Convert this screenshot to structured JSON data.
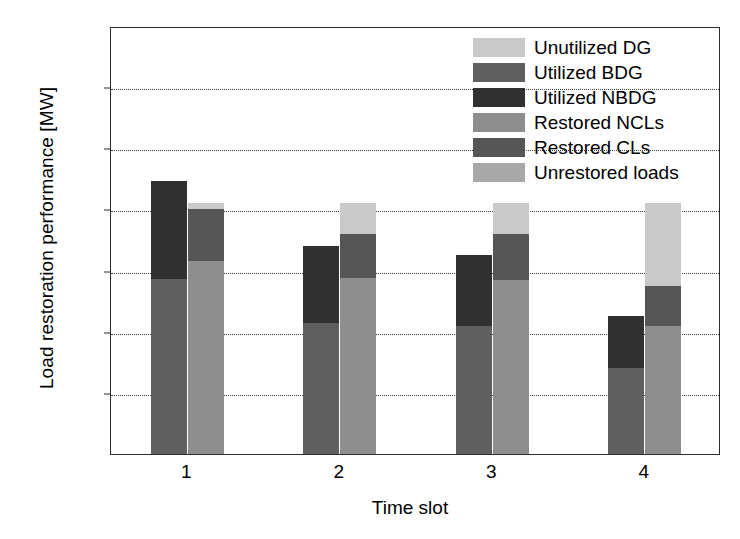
{
  "chart_data": {
    "type": "bar",
    "title": "",
    "xlabel": "Time slot",
    "ylabel": "Load restoration performance [MW]",
    "categories": [
      "1",
      "2",
      "3",
      "4"
    ],
    "ylim": [
      0,
      70
    ],
    "yticks": [
      0,
      10,
      20,
      30,
      40,
      50,
      60,
      70
    ],
    "ytick_labels": [
      "0",
      "10",
      "20",
      "30",
      "40",
      "50",
      "60",
      "70"
    ],
    "grid": true,
    "grid_style": "dotted",
    "legend_position": "top-right",
    "stacked": true,
    "grouped_bars_per_category": 2,
    "legend": [
      {
        "label": "Unutilized DG",
        "color": "#c9c9c9"
      },
      {
        "label": "Utilized BDG",
        "color": "#5f5f5f"
      },
      {
        "label": "Utilized NBDG",
        "color": "#303030"
      },
      {
        "label": "Restored NCLs",
        "color": "#8e8e8e"
      },
      {
        "label": "Restored CLs",
        "color": "#565656"
      },
      {
        "label": "Unrestored loads",
        "color": "#a8a8a8"
      }
    ],
    "series": [
      {
        "name": "Utilized BDG",
        "color": "#5f5f5f",
        "bar": "generation",
        "values": [
          28.6,
          21.5,
          21.0,
          14.0
        ]
      },
      {
        "name": "Utilized NBDG",
        "color": "#303030",
        "bar": "generation",
        "values": [
          16.0,
          12.5,
          11.5,
          8.5
        ]
      },
      {
        "name": "Restored NCLs",
        "color": "#8e8e8e",
        "bar": "load",
        "values": [
          31.5,
          28.8,
          28.5,
          21.0
        ]
      },
      {
        "name": "Restored CLs",
        "color": "#565656",
        "bar": "load",
        "values": [
          8.5,
          7.2,
          7.5,
          6.5
        ]
      },
      {
        "name": "Unutilized DG",
        "color": "#c9c9c9",
        "bar": "load",
        "values": [
          1.0,
          5.0,
          5.0,
          13.5
        ]
      }
    ],
    "bar_totals": {
      "generation": [
        44.6,
        34.0,
        32.5,
        22.5
      ],
      "load": [
        41.0,
        41.0,
        41.0,
        41.0
      ]
    }
  }
}
